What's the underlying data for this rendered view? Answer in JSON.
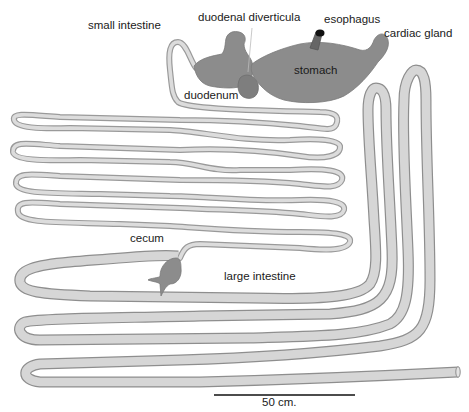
{
  "labels": {
    "small_intestine": "small intestine",
    "duodenal_diverticula": "duodenal diverticula",
    "esophagus": "esophagus",
    "cardiac_gland": "cardiac gland",
    "stomach": "stomach",
    "duodenum": "duodenum",
    "cecum": "cecum",
    "large_intestine": "large intestine"
  },
  "scale_bar": {
    "label": "50 cm.",
    "length_cm": 50
  },
  "colors": {
    "organ_fill": "#8c8c8c",
    "tube_fill": "#d8d8d8",
    "tube_outline": "#959595",
    "esophagus_tip": "#111111",
    "text": "#1a1a1a",
    "background": "#ffffff"
  }
}
